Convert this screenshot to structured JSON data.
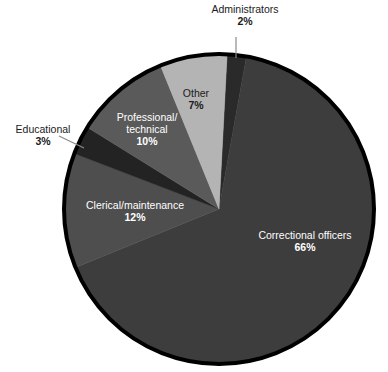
{
  "chart_data": {
    "type": "pie",
    "title": "",
    "subtitle": "",
    "xlabel": "",
    "ylabel": "",
    "legend_position": "none",
    "grid": false,
    "units": "percent",
    "total": 100,
    "start_angle_deg": 3,
    "direction": "clockwise",
    "categories": [
      "Administrators",
      "Correctional officers",
      "Clerical/maintenance",
      "Educational",
      "Professional/ technical",
      "Other"
    ],
    "values": [
      2,
      66,
      12,
      3,
      10,
      7
    ],
    "slices": [
      {
        "label": "Administrators",
        "label_line1": "Administrators",
        "value": 2,
        "percent_text": "2%",
        "color": "#2a2a2a",
        "label_placement": "outside",
        "label_color": "#1b1b1b",
        "leader_line": true
      },
      {
        "label": "Correctional officers",
        "label_line1": "Correctional officers",
        "value": 66,
        "percent_text": "66%",
        "color": "#3d3d3d",
        "label_placement": "inside",
        "label_color": "#ffffff",
        "leader_line": false
      },
      {
        "label": "Clerical/maintenance",
        "label_line1": "Clerical/maintenance",
        "value": 12,
        "percent_text": "12%",
        "color": "#4e4e4e",
        "label_placement": "inside",
        "label_color": "#ffffff",
        "leader_line": false
      },
      {
        "label": "Educational",
        "label_line1": "Educational",
        "value": 3,
        "percent_text": "3%",
        "color": "#232323",
        "label_placement": "outside",
        "label_color": "#1b1b1b",
        "leader_line": true
      },
      {
        "label": "Professional/ technical",
        "label_line1": "Professional/",
        "label_line2": "technical",
        "value": 10,
        "percent_text": "10%",
        "color": "#5a5a5a",
        "label_placement": "inside",
        "label_color": "#ffffff",
        "leader_line": false
      },
      {
        "label": "Other",
        "label_line1": "Other",
        "value": 7,
        "percent_text": "7%",
        "color": "#b4b4b4",
        "label_placement": "inside",
        "label_color": "#1b1b1b",
        "leader_line": false
      }
    ],
    "style": {
      "background": "#ffffff",
      "outline_color": "#000000",
      "outline_width": 4,
      "center_x": 219,
      "center_y": 209,
      "radius": 155
    }
  }
}
